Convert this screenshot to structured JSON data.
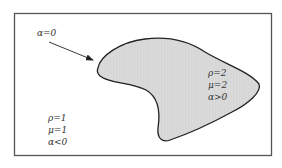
{
  "diagram": {
    "arrow_label": "α=0",
    "inside_region": {
      "labels": [
        "ρ=2",
        "μ=2",
        "α>0"
      ],
      "fill_color": "#d9d9d9"
    },
    "outside_region": {
      "labels": [
        "ρ=1",
        "μ=1",
        "α<0"
      ]
    },
    "colors": {
      "frame": "#555555",
      "boundary": "#222222",
      "text": "#333333"
    }
  }
}
